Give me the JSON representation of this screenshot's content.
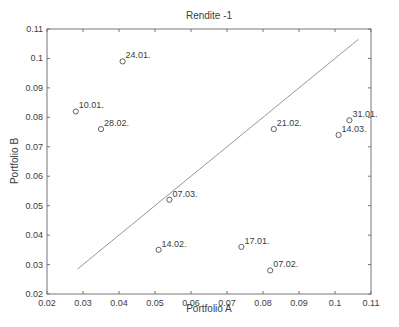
{
  "figure": {
    "title": "Rendite -1"
  },
  "chart_data": {
    "type": "scatter",
    "title": "Rendite -1",
    "xlabel": "Portfolio A",
    "ylabel": "Portfolio B",
    "xlim": [
      0.02,
      0.11
    ],
    "ylim": [
      0.02,
      0.11
    ],
    "xticks": [
      0.02,
      0.03,
      0.04,
      0.05,
      0.06,
      0.07,
      0.08,
      0.09,
      0.1,
      0.11
    ],
    "xtick_labels": [
      "0.02",
      "0.03",
      "0.04",
      "0.05",
      "0.06",
      "0.07",
      "0.08",
      "0.09",
      "0.1",
      "0.11"
    ],
    "yticks": [
      0.02,
      0.03,
      0.04,
      0.05,
      0.06,
      0.07,
      0.08,
      0.09,
      0.1,
      0.11
    ],
    "ytick_labels": [
      "0.02",
      "0.03",
      "0.04",
      "0.05",
      "0.06",
      "0.07",
      "0.08",
      "0.09",
      "0.1",
      "0.11"
    ],
    "grid": false,
    "legend": null,
    "points": [
      {
        "label": "10.01.",
        "x": 0.028,
        "y": 0.082
      },
      {
        "label": "17.01.",
        "x": 0.074,
        "y": 0.036
      },
      {
        "label": "24.01.",
        "x": 0.041,
        "y": 0.099
      },
      {
        "label": "31.01.",
        "x": 0.104,
        "y": 0.079
      },
      {
        "label": "07.02.",
        "x": 0.082,
        "y": 0.028
      },
      {
        "label": "14.02.",
        "x": 0.051,
        "y": 0.035
      },
      {
        "label": "21.02.",
        "x": 0.083,
        "y": 0.076
      },
      {
        "label": "28.02.",
        "x": 0.035,
        "y": 0.076
      },
      {
        "label": "07.03.",
        "x": 0.054,
        "y": 0.052
      },
      {
        "label": "14.03.",
        "x": 0.101,
        "y": 0.074
      }
    ],
    "line": {
      "name": "identity-line",
      "x": [
        0.0285,
        0.1065
      ],
      "y": [
        0.0285,
        0.1065
      ]
    },
    "marker": "open-circle",
    "colors": {
      "axis": "#767676",
      "text": "#3d3d3d",
      "marker": "#4f4f4f",
      "line": "#979797",
      "background": "#ffffff"
    }
  }
}
